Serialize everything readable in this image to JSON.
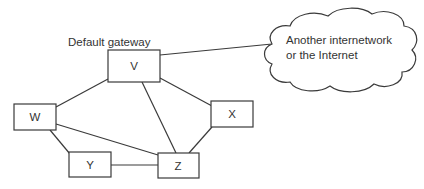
{
  "diagram": {
    "annotation": "Default gateway",
    "cloud": {
      "line1": "Another internetwork",
      "line2": "or the Internet"
    },
    "nodes": {
      "V": "V",
      "W": "W",
      "X": "X",
      "Y": "Y",
      "Z": "Z"
    },
    "links": [
      [
        "V",
        "Cloud"
      ],
      [
        "V",
        "W"
      ],
      [
        "V",
        "X"
      ],
      [
        "V",
        "Z"
      ],
      [
        "W",
        "Y"
      ],
      [
        "W",
        "Z"
      ],
      [
        "Y",
        "Z"
      ],
      [
        "X",
        "Z"
      ]
    ],
    "colors": {
      "stroke": "#3a3a3a",
      "text": "#333333",
      "background": "#ffffff"
    }
  }
}
